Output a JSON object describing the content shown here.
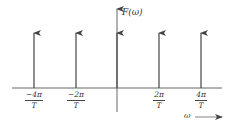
{
  "diagram": {
    "y_axis_label": "F(ω)",
    "x_axis_label": "ω",
    "impulses": [
      {
        "position": "-4π/T",
        "num": "−4π",
        "den": "T"
      },
      {
        "position": "-2π/T",
        "num": "−2π",
        "den": "T"
      },
      {
        "position": "0",
        "num": "",
        "den": ""
      },
      {
        "position": "2π/T",
        "num": "2π",
        "den": "T"
      },
      {
        "position": "4π/T",
        "num": "4π",
        "den": "T"
      }
    ],
    "colors": {
      "line": "#444444",
      "text": "#333333"
    }
  }
}
